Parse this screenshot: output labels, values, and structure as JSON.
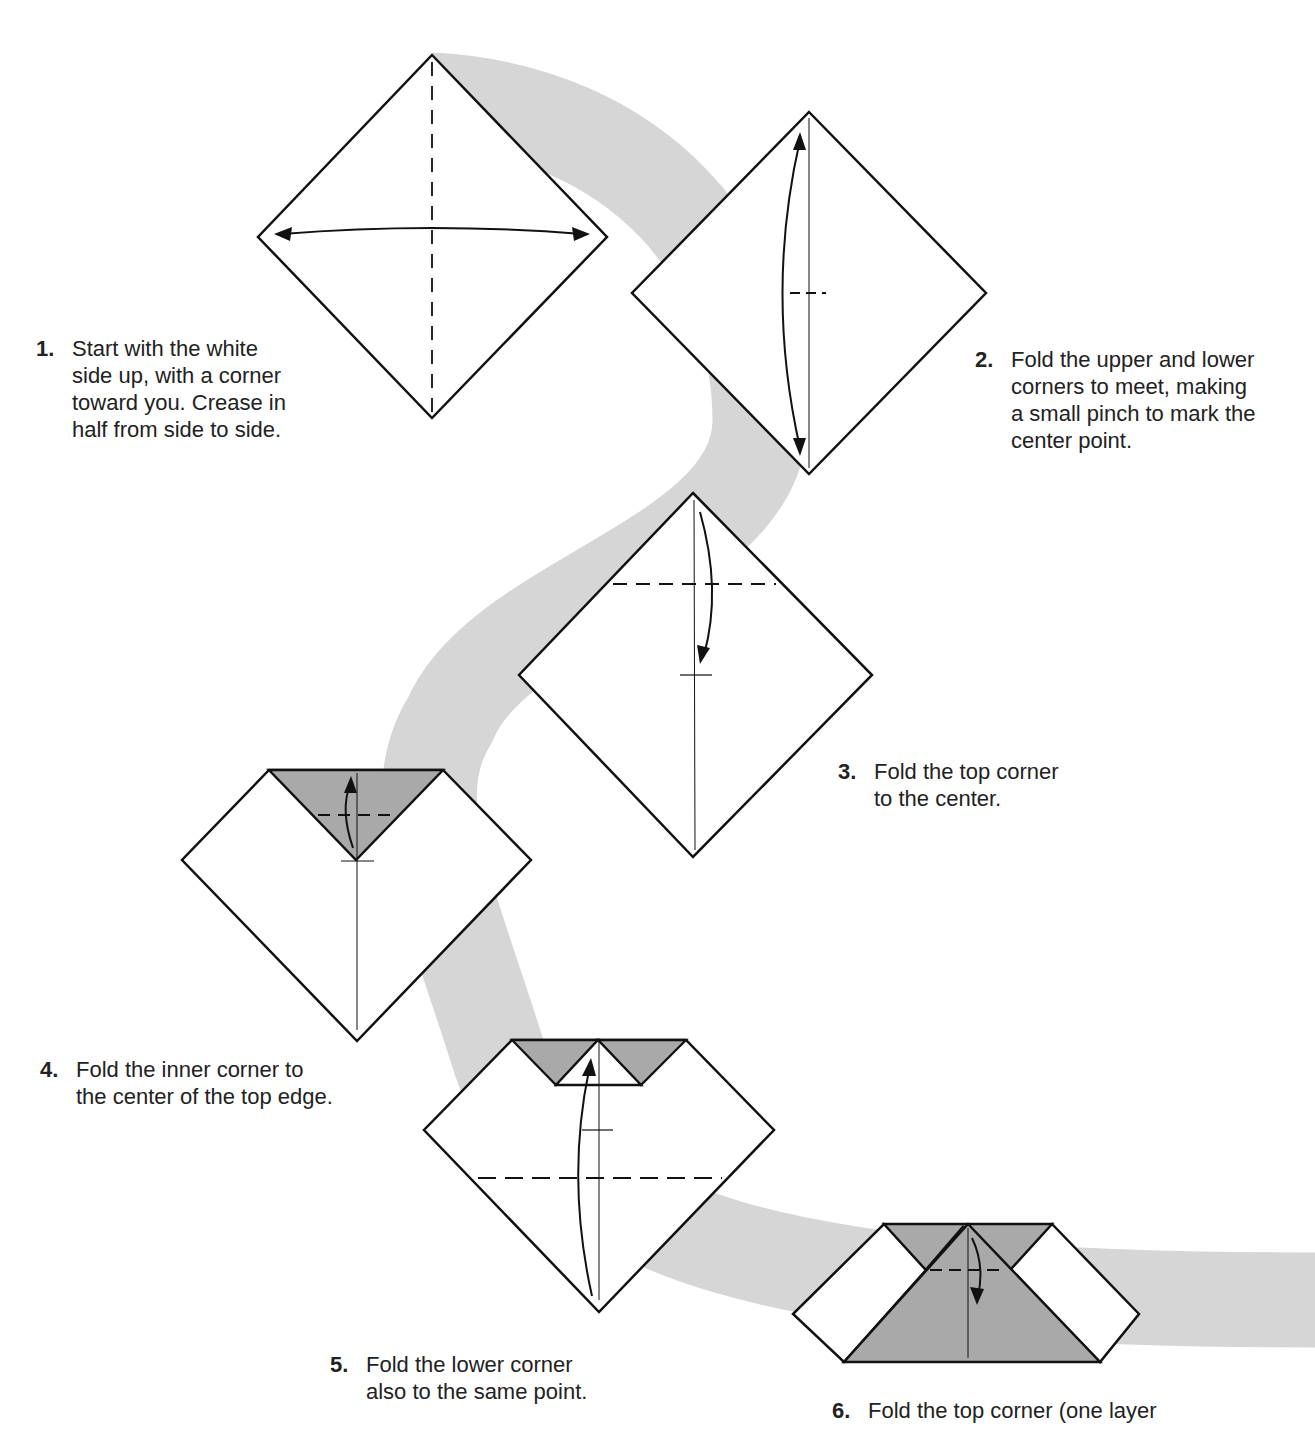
{
  "colors": {
    "background": "#ffffff",
    "swoosh": "#d6d6d6",
    "paper_white": "#ffffff",
    "paper_colored": "#a9a9a9",
    "ink": "#111111"
  },
  "steps": [
    {
      "number": "1.",
      "text": "Start with the white\nside up, with a corner\ntoward you. Crease in\nhalf from side to side."
    },
    {
      "number": "2.",
      "text": "Fold the upper and lower\ncorners to meet, making\na small pinch to mark the\ncenter point."
    },
    {
      "number": "3.",
      "text": "Fold the top corner\nto the center."
    },
    {
      "number": "4.",
      "text": "Fold the inner corner to\nthe center of the top edge."
    },
    {
      "number": "5.",
      "text": "Fold the lower corner\nalso to the same point."
    },
    {
      "number": "6.",
      "text": "Fold the top corner (one layer"
    }
  ]
}
